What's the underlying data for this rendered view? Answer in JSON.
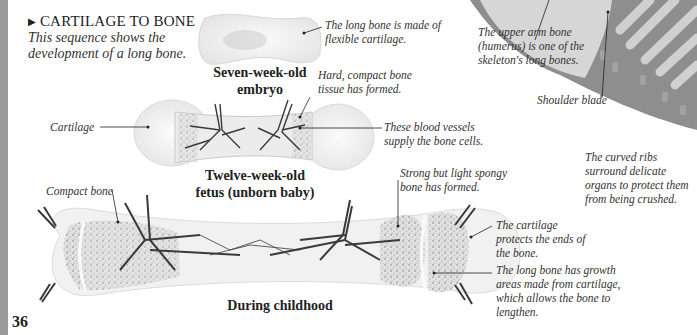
{
  "section": {
    "marker": "▶",
    "heading": "CARTILAGE TO BONE",
    "intro": "This sequence shows the development of a long bone."
  },
  "stages": [
    {
      "label": "Seven-week-old embryo",
      "line1": "Seven-week-old",
      "line2": "embryo"
    },
    {
      "label": "Twelve-week-old fetus (unborn baby)",
      "line1": "Twelve-week-old",
      "line2": "fetus (unborn baby)"
    },
    {
      "label": "During childhood",
      "line1": "During childhood"
    }
  ],
  "captions": {
    "embryo_cartilage": "The long bone is made of flexible cartilage.",
    "compact_tissue": "Hard, compact bone tissue has formed.",
    "cartilage_label": "Cartilage",
    "blood_vessels": "These blood vessels supply the bone cells.",
    "compact_bone": "Compact bone",
    "spongy_bone": "Strong but light spongy bone has formed.",
    "cartilage_protects": "The cartilage protects the ends of the bone.",
    "growth_areas": "The long bone has growth areas made from cartilage, which allows the bone to lengthen.",
    "humerus": "The upper arm bone (humerus) is one of the skeleton's long bones.",
    "shoulder_blade": "Shoulder blade",
    "ribs": "The curved ribs surround delicate organs to protect them from being crushed."
  },
  "page_number": "36",
  "colors": {
    "edge_strip": "#9a9a9a",
    "skeleton_gray": "#8e8e8e",
    "vessel": "#3a3a3a",
    "text": "#2a2a2a"
  }
}
